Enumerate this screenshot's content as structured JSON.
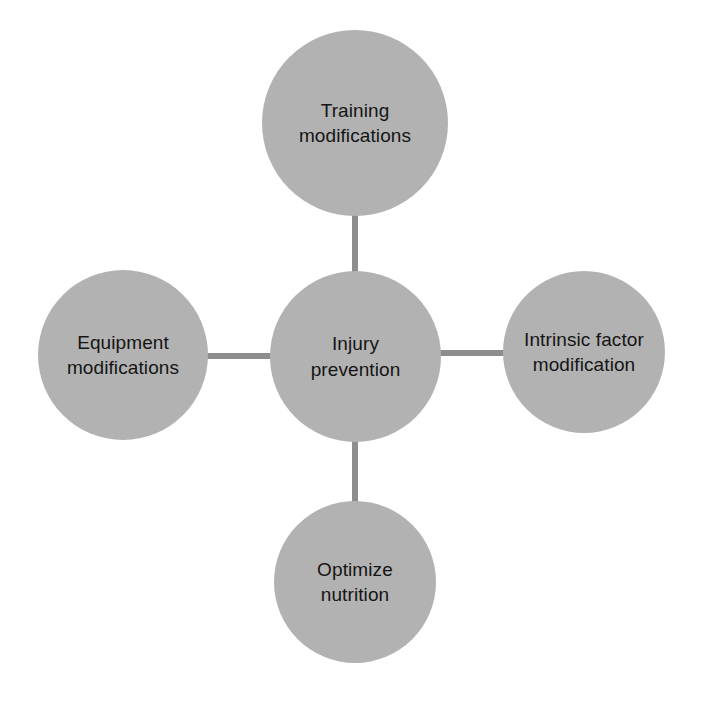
{
  "diagram": {
    "title": "Injury prevention",
    "type": "hub-and-spoke",
    "canvas": {
      "width": 702,
      "height": 704,
      "background": "#ffffff"
    },
    "colors": {
      "node_fill": "#b2b2b2",
      "connector": "#8d8d8d",
      "label_text": "#151515"
    },
    "center_node": {
      "id": "injury-prevention",
      "label": "Injury\nprevention",
      "line1": "Injury",
      "line2": "prevention"
    },
    "nodes": [
      {
        "id": "training-modifications",
        "position": "top",
        "label": "Training\nmodifications",
        "line1": "Training",
        "line2": "modifications"
      },
      {
        "id": "intrinsic-factor-modification",
        "position": "right",
        "label": "Intrinsic factor\nmodification",
        "line1": "Intrinsic factor",
        "line2": "modification"
      },
      {
        "id": "optimize-nutrition",
        "position": "bottom",
        "label": "Optimize\nnutrition",
        "line1": "Optimize",
        "line2": "nutrition"
      },
      {
        "id": "equipment-modifications",
        "position": "left",
        "label": "Equipment\nmodifications",
        "line1": "Equipment",
        "line2": "modifications"
      }
    ],
    "connectors": [
      {
        "id": "center-to-top",
        "from": "injury-prevention",
        "to": "training-modifications",
        "orientation": "vertical"
      },
      {
        "id": "center-to-bottom",
        "from": "injury-prevention",
        "to": "optimize-nutrition",
        "orientation": "vertical"
      },
      {
        "id": "center-to-left",
        "from": "injury-prevention",
        "to": "equipment-modifications",
        "orientation": "horizontal"
      },
      {
        "id": "center-to-right",
        "from": "injury-prevention",
        "to": "intrinsic-factor-modification",
        "orientation": "horizontal"
      }
    ]
  }
}
